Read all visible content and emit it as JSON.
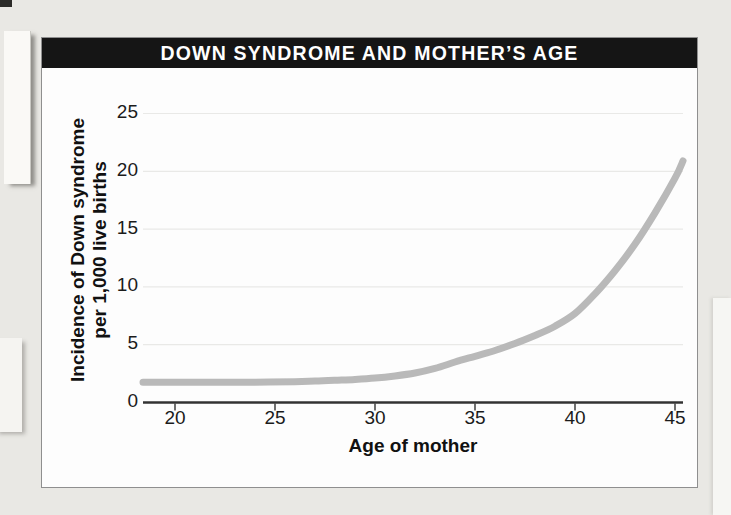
{
  "title": "DOWN SYNDROME AND MOTHER’S AGE",
  "chart_data": {
    "type": "line",
    "title": "DOWN SYNDROME AND MOTHER’S AGE",
    "xlabel": "Age of mother",
    "ylabel": "Incidence of Down syndrome per 1,000 live births",
    "ylabel_line1": "Incidence of Down syndrome",
    "ylabel_line2": "per 1,000 live births",
    "x_ticks": [
      20,
      25,
      30,
      35,
      40,
      45
    ],
    "y_ticks": [
      0,
      5,
      10,
      15,
      20,
      25
    ],
    "xlim": [
      18.4,
      45.4
    ],
    "ylim": [
      0,
      25
    ],
    "grid": "faint horizontal gridlines at each y tick",
    "legend": "none",
    "series": [
      {
        "name": "Incidence of Down syndrome per 1,000 live births",
        "color": "#b9b9b9",
        "points": [
          [
            18.4,
            1.75
          ],
          [
            20,
            1.75
          ],
          [
            22,
            1.75
          ],
          [
            24,
            1.76
          ],
          [
            26,
            1.8
          ],
          [
            27,
            1.85
          ],
          [
            28,
            1.92
          ],
          [
            29,
            2.0
          ],
          [
            30,
            2.12
          ],
          [
            31,
            2.3
          ],
          [
            32,
            2.55
          ],
          [
            33,
            2.95
          ],
          [
            34,
            3.5
          ],
          [
            35,
            4.0
          ],
          [
            36,
            4.5
          ],
          [
            37,
            5.1
          ],
          [
            38,
            5.8
          ],
          [
            39,
            6.6
          ],
          [
            40,
            7.7
          ],
          [
            41,
            9.4
          ],
          [
            42,
            11.4
          ],
          [
            43,
            13.7
          ],
          [
            44,
            16.4
          ],
          [
            45,
            19.4
          ],
          [
            45.4,
            20.9
          ]
        ]
      }
    ]
  },
  "colors": {
    "title_bar_bg": "#151515",
    "title_text": "#ffffff",
    "chart_bg": "#fdfdfd",
    "box_border": "#8f8f8f",
    "axis": "#333333",
    "tick_text": "#1b1b1b",
    "curve": "#b9b9b9",
    "gridline": "#e9e9e7",
    "page_bg": "#e9e8e4"
  }
}
